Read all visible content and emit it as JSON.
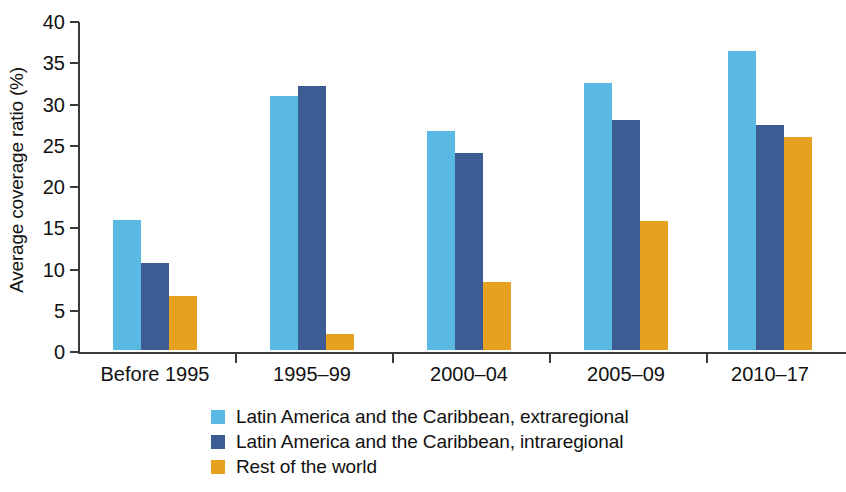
{
  "chart_data": {
    "type": "bar",
    "title": "",
    "subtitle": "",
    "xlabel": "",
    "ylabel": "Average coverage ratio (%)",
    "categories": [
      "Before 1995",
      "1995–99",
      "2000–04",
      "2005–09",
      "2010–17"
    ],
    "series": [
      {
        "name": "Latin America and the Caribbean, extraregional",
        "color": "#5ab9e2",
        "values": [
          15.8,
          30.8,
          26.6,
          32.4,
          36.2
        ]
      },
      {
        "name": "Latin America and the Caribbean, intraregional",
        "color": "#3c5c93",
        "values": [
          10.6,
          32.0,
          23.9,
          27.9,
          27.3
        ]
      },
      {
        "name": "Rest of the world",
        "color": "#e5a11f",
        "values": [
          6.6,
          1.9,
          8.2,
          15.6,
          25.8
        ]
      }
    ],
    "ylim": [
      0,
      40
    ],
    "yticks": [
      0,
      5,
      10,
      15,
      20,
      25,
      30,
      35,
      40
    ],
    "ytick_labels": [
      "0",
      "5",
      "10",
      "15",
      "20",
      "25",
      "30",
      "35",
      "40"
    ],
    "grid": false,
    "legend_position": "bottom-left"
  }
}
